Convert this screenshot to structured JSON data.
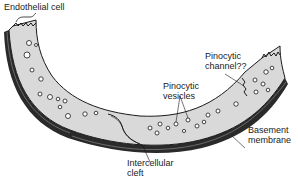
{
  "figure": {
    "colors": {
      "cytoplasm": "#d9d9d9",
      "outline": "#1a1a1a",
      "membrane": "#2a2a2a",
      "background": "#ffffff"
    }
  },
  "labels": {
    "endothelial_cell": "Endothelial cell",
    "pinocytic_channel": "Pinocytic\nchannel??",
    "pinocytic_vesicles": "Pinocytic\nvesicles",
    "basement_membrane": "Basement\nmembrane",
    "intercellular_cleft": "Intercellular\ncleft"
  }
}
